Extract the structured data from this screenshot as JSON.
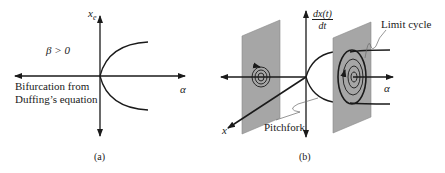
{
  "panel_a": {
    "caption": "(a)",
    "y_axis_label": "x",
    "y_axis_subscript": "e",
    "x_axis_label": "α",
    "condition": "β > 0",
    "description_line1": "Bifurcation from",
    "description_line2": "Duffing’s equation"
  },
  "panel_b": {
    "caption": "(b)",
    "y_axis_label_num": "dx(t)",
    "y_axis_label_den": "dt",
    "x_axis_label": "α",
    "depth_axis_label": "x",
    "limit_cycle_label": "Limit cycle",
    "pitchfork_label": "Pitchfork"
  },
  "colors": {
    "line": "#1a1a1a",
    "plane_fill": "#a6a6a6",
    "plane_stroke": "#8a8a8a"
  }
}
